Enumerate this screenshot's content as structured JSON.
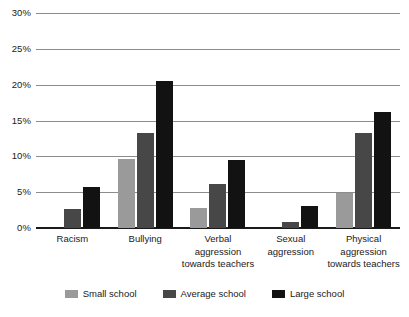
{
  "chart_data": {
    "type": "bar",
    "title": "",
    "subtitle": "",
    "xlabel": "",
    "ylabel": "",
    "ylim": [
      0,
      30
    ],
    "ytick_values": [
      0,
      5,
      10,
      15,
      20,
      25,
      30
    ],
    "ytick_labels": [
      "0%",
      "5%",
      "10%",
      "15%",
      "20%",
      "25%",
      "30%"
    ],
    "grid": true,
    "legend_position": "bottom",
    "categories": [
      "Racism",
      "Bullying",
      "Verbal\naggression\ntowards teachers",
      "Sexual\naggression",
      "Physical\naggression\ntowards teachers"
    ],
    "series": [
      {
        "name": "Small school",
        "color": "#9a9a9a",
        "values": [
          0,
          9.6,
          2.8,
          0,
          4.9
        ]
      },
      {
        "name": "Average school",
        "color": "#474747",
        "values": [
          2.7,
          13.2,
          6.1,
          0.8,
          13.2
        ]
      },
      {
        "name": "Large school",
        "color": "#121212",
        "values": [
          5.7,
          20.5,
          9.5,
          3.1,
          16.2
        ]
      }
    ]
  },
  "axis": {
    "y_ticks": [
      {
        "label": "30%",
        "value": 30
      },
      {
        "label": "25%",
        "value": 25
      },
      {
        "label": "20%",
        "value": 20
      },
      {
        "label": "15%",
        "value": 15
      },
      {
        "label": "10%",
        "value": 10
      },
      {
        "label": "5%",
        "value": 5
      },
      {
        "label": "0%",
        "value": 0
      }
    ]
  },
  "legend": {
    "items": [
      {
        "label": "Small school",
        "color": "#9a9a9a"
      },
      {
        "label": "Average school",
        "color": "#474747"
      },
      {
        "label": "Large school",
        "color": "#121212"
      }
    ]
  }
}
